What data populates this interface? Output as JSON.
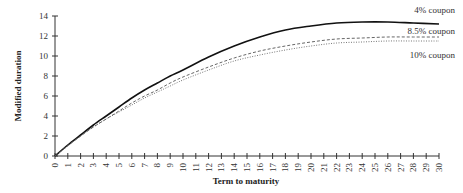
{
  "chart_data": {
    "type": "line",
    "title": "",
    "xlabel": "Term to maturity",
    "ylabel": "Modified duration",
    "xlim": [
      0,
      30
    ],
    "ylim": [
      0,
      14
    ],
    "x_ticks": [
      0,
      1,
      2,
      3,
      4,
      5,
      6,
      7,
      8,
      9,
      10,
      11,
      12,
      13,
      14,
      15,
      16,
      17,
      18,
      19,
      20,
      21,
      22,
      23,
      24,
      25,
      26,
      27,
      28,
      29,
      30
    ],
    "y_ticks": [
      0,
      2,
      4,
      6,
      8,
      10,
      12,
      14
    ],
    "grid": false,
    "legend_position": "right, inline labels",
    "x": [
      0,
      1,
      2,
      3,
      4,
      5,
      6,
      7,
      8,
      9,
      10,
      12,
      14,
      16,
      18,
      20,
      22,
      24,
      26,
      28,
      30
    ],
    "series": [
      {
        "name": "4% coupon",
        "style": "solid",
        "values": [
          0,
          1.1,
          2.1,
          3.1,
          4.0,
          4.9,
          5.8,
          6.6,
          7.3,
          8.0,
          8.6,
          9.9,
          11.0,
          11.9,
          12.6,
          13.0,
          13.3,
          13.4,
          13.4,
          13.3,
          13.2
        ]
      },
      {
        "name": "8.5% coupon",
        "style": "dashed",
        "values": [
          0,
          1.05,
          2.0,
          2.9,
          3.7,
          4.5,
          5.3,
          6.0,
          6.6,
          7.3,
          7.9,
          8.9,
          9.8,
          10.5,
          11.0,
          11.4,
          11.7,
          11.8,
          11.9,
          11.9,
          11.9
        ]
      },
      {
        "name": "10% coupon",
        "style": "dotted",
        "values": [
          0,
          1.0,
          2.0,
          2.9,
          3.7,
          4.4,
          5.1,
          5.8,
          6.4,
          7.0,
          7.6,
          8.6,
          9.5,
          10.1,
          10.6,
          11.0,
          11.3,
          11.4,
          11.5,
          11.5,
          11.5
        ]
      }
    ]
  },
  "labels": {
    "ylabel": "Modified duration",
    "xlabel": "Term to maturity",
    "legend": [
      "4% coupon",
      "8.5% coupon",
      "10% coupon"
    ]
  }
}
